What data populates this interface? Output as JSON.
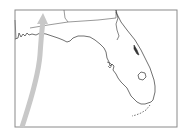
{
  "map": {
    "region": "Florida",
    "frame": {
      "x": 15,
      "y": 10,
      "width": 162,
      "height": 117,
      "stroke": "#8a8a8a"
    },
    "colors": {
      "background": "#ffffff",
      "coastline": "#333333",
      "state_border": "#555555",
      "track": "#c8c8c8"
    },
    "features": [
      {
        "name": "state-border",
        "type": "boundary"
      },
      {
        "name": "florida-coastline",
        "type": "coastline"
      },
      {
        "name": "lake-okeechobee",
        "type": "lake"
      },
      {
        "name": "storm-track-arrow",
        "type": "track",
        "direction": "north"
      }
    ]
  }
}
